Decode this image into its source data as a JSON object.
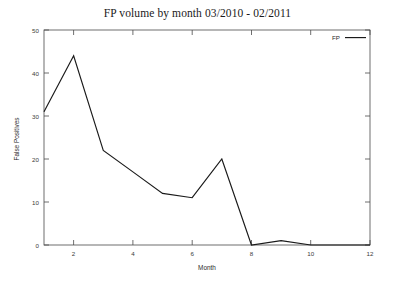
{
  "chart_data": {
    "type": "line",
    "title": "FP volume by month 03/2010 - 02/2011",
    "xlabel": "Month",
    "ylabel": "False Positives",
    "x": [
      1,
      2,
      3,
      4,
      5,
      6,
      7,
      8,
      9,
      10,
      11,
      12
    ],
    "series": [
      {
        "name": "FP",
        "color": "#1a1a1a",
        "values": [
          31,
          44,
          22,
          17,
          12,
          11,
          20,
          0,
          1,
          0,
          0,
          0
        ]
      }
    ],
    "xlim": [
      1,
      12
    ],
    "ylim": [
      0,
      50
    ],
    "xticks": [
      2,
      4,
      6,
      8,
      10,
      12
    ],
    "xtick_labels": [
      "2",
      "4",
      "6",
      "8",
      "10",
      "12"
    ],
    "yticks": [
      0,
      10,
      20,
      30,
      40,
      50
    ],
    "ytick_labels": [
      "0",
      "10",
      "20",
      "30",
      "40",
      "50"
    ],
    "grid": false,
    "legend": {
      "position": "top-right-inside",
      "entries": [
        "FP"
      ]
    },
    "frame": "box",
    "tick_direction": "in"
  }
}
